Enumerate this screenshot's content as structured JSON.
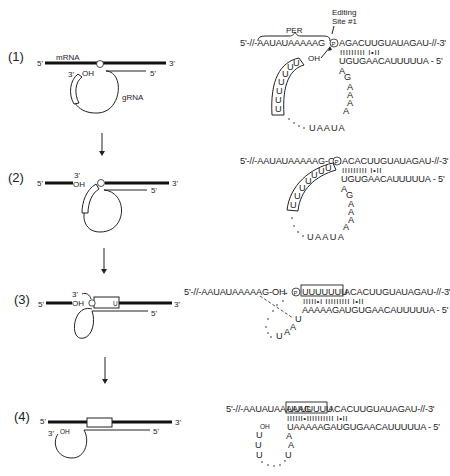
{
  "figure": {
    "steps": [
      {
        "label": "(1)",
        "left": {
          "mrna_label": "mRNA",
          "grna_label": "gRNA",
          "five_prime_left": "5'",
          "three_prime_right": "3'",
          "grna_three": "3'",
          "grna_oh": "OH",
          "grna_five": "5'"
        },
        "right": {
          "per_label": "PER",
          "editing_site_label_1": "Editing",
          "editing_site_label_2": "Site #1",
          "mrna_seq": "5'-//-AAUAUAAAAAG",
          "phosphate": "P",
          "mrna_seq_right": "AGACUUGUAUAGAU-//-3'",
          "pairing": "IIIIIIIII  I•II",
          "grna_seq": "UGUGAACAUUUUUA - 5'",
          "oh": "OH",
          "u_tail": [
            "U",
            "U",
            "U",
            "U",
            "U",
            "U",
            "U"
          ],
          "loop_letters": [
            "A",
            "G",
            "A",
            "A",
            "A",
            "A"
          ],
          "loop_bottom": "UAAUA"
        }
      },
      {
        "label": "(2)",
        "left": {
          "five_prime_left": "5'",
          "three_prime_oh_top": "3'",
          "oh": "OH",
          "three_prime_right": "3'",
          "grna_five": "5'"
        },
        "right": {
          "mrna_seq": "5'-//-AAUAUAAAAAG-OH",
          "phosphate": "P",
          "mrna_seq_right": "ACACUUGUAUAGAU-//-3'",
          "pairing": "IIIIIIIII  I•II",
          "grna_seq": "UGUGAACAUUUUUA - 5'",
          "u_tail": [
            "U",
            "U",
            "U",
            "U",
            "U",
            "U",
            "U"
          ],
          "loop_letters": [
            "A",
            "G",
            "A",
            "A",
            "A",
            "A"
          ],
          "loop_bottom": "UAAUA"
        }
      },
      {
        "label": "(3)",
        "left": {
          "five_prime_left": "5'",
          "three_prime_top": "3'",
          "oh": "OH",
          "phosphate": "P",
          "u_mark": "U",
          "three_prime_right": "3'",
          "grna_five": "5'"
        },
        "right": {
          "mrna_seq": "5'-//-AAUAUAAAAAG-OH",
          "arrow": "→",
          "phosphate": "P",
          "inserted_u": "UUUUUUU",
          "mrna_seq_right": "ACACUUGUAUAGAU-//-3'",
          "pairing": "IIIII•I IIIIIIIII  I•II",
          "grna_seq": "AAAAAGAUGUGAACAUUUUUA - 5'",
          "loop_letters": [
            "U",
            "A",
            "A",
            "U"
          ]
        }
      },
      {
        "label": "(4)",
        "left": {
          "five_prime_left": "5'",
          "three_prime_right": "3'",
          "grna_three": "3'",
          "oh": "OH",
          "grna_five": "5'"
        },
        "right": {
          "mrna_seq": "5'-//-AAUAUAAAAAG",
          "inserted_u": "UUUUUUU",
          "mrna_seq_right": "ACACUUGUAUAGAU-//-3'",
          "pairing": "IIIIII•IIIIIIIIII  I•II",
          "grna_seq": "UAAAAAGAUGUGAACAUUUUUA - 5'",
          "oh": "OH",
          "u_tail": [
            "U",
            "U",
            "U"
          ],
          "loop_letters": [
            "A",
            "A",
            "U"
          ]
        }
      }
    ]
  }
}
